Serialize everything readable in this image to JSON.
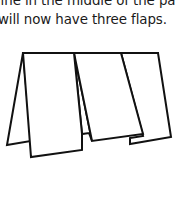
{
  "document": {
    "paragraph": {
      "lines": [
        "line in the middle of the paper",
        "will now have three flaps."
      ]
    },
    "figure": {
      "description": "Paper folded into a standing zig-zag with three flaps",
      "stroke_color": "#111111",
      "fill_color": "#ffffff",
      "panels": [
        "left-back-flap",
        "front-flap",
        "middle-flap",
        "right-flap"
      ]
    }
  }
}
